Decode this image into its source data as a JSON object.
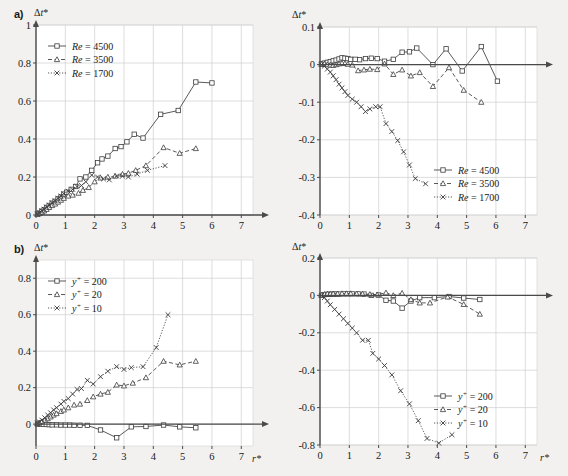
{
  "figure": {
    "background_color": "#f2f1ef",
    "axis_color": "#4a4a4a",
    "grid_color": "#cfcfcf",
    "series_color": "#3c3c3c"
  },
  "panels": [
    {
      "tag": "a)",
      "position": "top-left",
      "ylabel": "Δt*",
      "xlabel": "",
      "legend_position": "top-left"
    },
    {
      "tag": "",
      "position": "top-right",
      "ylabel": "Δt*",
      "xlabel": "",
      "legend_position": "bottom-right"
    },
    {
      "tag": "b)",
      "position": "bottom-left",
      "ylabel": "Δt*",
      "xlabel": "r*",
      "legend_position": "top-left"
    },
    {
      "tag": "",
      "position": "bottom-right",
      "ylabel": "Δt*",
      "xlabel": "r*",
      "legend_position": "bottom-right"
    }
  ],
  "chart_data": [
    {
      "id": "panel-a-left",
      "type": "line",
      "title": "a)",
      "xlabel": "",
      "ylabel": "Δt*",
      "xlim": [
        0,
        7.4
      ],
      "ylim": [
        0,
        1.0
      ],
      "xticks": [
        0,
        1,
        2,
        3,
        4,
        5,
        6,
        7
      ],
      "yticks": [
        0,
        0.2,
        0.4,
        0.6,
        0.8,
        1
      ],
      "ytick_labels": [
        "0",
        "0.2",
        "0.4",
        "0.6",
        "0.8",
        "1"
      ],
      "grid": true,
      "legend_position": "top-left",
      "series": [
        {
          "name": "Re = 4500",
          "marker": "square",
          "dash": "solid",
          "x": [
            0.05,
            0.12,
            0.2,
            0.28,
            0.36,
            0.45,
            0.55,
            0.65,
            0.75,
            0.85,
            0.95,
            1.05,
            1.2,
            1.35,
            1.5,
            1.7,
            1.9,
            2.1,
            2.25,
            2.45,
            2.7,
            2.9,
            3.1,
            3.35,
            3.65,
            4.25,
            4.85,
            5.45,
            6.0
          ],
          "y": [
            0.005,
            0.01,
            0.02,
            0.028,
            0.04,
            0.05,
            0.062,
            0.072,
            0.085,
            0.095,
            0.11,
            0.12,
            0.135,
            0.15,
            0.19,
            0.2,
            0.235,
            0.275,
            0.295,
            0.31,
            0.35,
            0.36,
            0.385,
            0.425,
            0.405,
            0.53,
            0.55,
            0.7,
            0.695
          ]
        },
        {
          "name": "Re = 3500",
          "marker": "triangle",
          "dash": "dashed",
          "x": [
            0.05,
            0.12,
            0.2,
            0.28,
            0.36,
            0.45,
            0.55,
            0.65,
            0.75,
            0.85,
            0.95,
            1.1,
            1.25,
            1.45,
            1.6,
            1.8,
            2.0,
            2.2,
            2.45,
            2.7,
            2.95,
            3.15,
            3.4,
            3.75,
            4.35,
            4.9,
            5.45
          ],
          "y": [
            0.004,
            0.008,
            0.015,
            0.022,
            0.03,
            0.04,
            0.05,
            0.058,
            0.068,
            0.078,
            0.088,
            0.1,
            0.105,
            0.115,
            0.13,
            0.145,
            0.175,
            0.195,
            0.2,
            0.205,
            0.215,
            0.22,
            0.235,
            0.26,
            0.355,
            0.325,
            0.35
          ]
        },
        {
          "name": "Re = 1700",
          "marker": "x",
          "dash": "dotted",
          "x": [
            0.05,
            0.12,
            0.2,
            0.28,
            0.36,
            0.45,
            0.55,
            0.65,
            0.75,
            0.85,
            0.95,
            1.1,
            1.25,
            1.4,
            1.55,
            1.7,
            1.9,
            2.1,
            2.3,
            2.5,
            2.75,
            2.95,
            3.15,
            3.45,
            3.8,
            4.4
          ],
          "y": [
            0.006,
            0.012,
            0.022,
            0.03,
            0.042,
            0.052,
            0.065,
            0.075,
            0.088,
            0.1,
            0.112,
            0.125,
            0.135,
            0.15,
            0.155,
            0.175,
            0.21,
            0.2,
            0.19,
            0.185,
            0.205,
            0.205,
            0.2,
            0.215,
            0.235,
            0.26
          ]
        }
      ]
    },
    {
      "id": "panel-a-right",
      "type": "line",
      "title": "",
      "xlabel": "",
      "ylabel": "Δt*",
      "xlim": [
        0,
        7.4
      ],
      "ylim": [
        -0.4,
        0.1
      ],
      "xticks": [
        0,
        1,
        2,
        3,
        4,
        5,
        6,
        7
      ],
      "yticks": [
        0.1,
        0,
        -0.1,
        -0.2,
        -0.3,
        -0.4
      ],
      "ytick_labels": [
        "0.1",
        "0",
        "-0.1",
        "-0.2",
        "-0.3",
        "-0.4"
      ],
      "grid": true,
      "legend_position": "bottom-right",
      "series": [
        {
          "name": "Re = 4500",
          "marker": "square",
          "dash": "solid",
          "x": [
            0.05,
            0.15,
            0.25,
            0.35,
            0.45,
            0.55,
            0.65,
            0.75,
            0.85,
            0.95,
            1.05,
            1.2,
            1.35,
            1.55,
            1.75,
            1.95,
            2.2,
            2.5,
            2.8,
            3.05,
            3.3,
            3.85,
            4.3,
            4.85,
            5.5,
            6.05
          ],
          "y": [
            0.002,
            0.004,
            0.006,
            0.008,
            0.01,
            0.012,
            0.015,
            0.018,
            0.017,
            0.016,
            0.014,
            0.014,
            0.013,
            0.016,
            0.017,
            0.016,
            0.009,
            0.014,
            0.033,
            0.034,
            0.044,
            0.0,
            0.042,
            -0.017,
            0.048,
            -0.044
          ]
        },
        {
          "name": "Re = 3500",
          "marker": "triangle",
          "dash": "dashed",
          "x": [
            0.05,
            0.15,
            0.25,
            0.35,
            0.45,
            0.55,
            0.65,
            0.75,
            0.85,
            0.95,
            1.1,
            1.3,
            1.5,
            1.7,
            1.95,
            2.2,
            2.5,
            2.8,
            3.1,
            3.4,
            3.85,
            4.4,
            4.9,
            5.5
          ],
          "y": [
            0.001,
            0.002,
            0.0,
            -0.001,
            -0.002,
            0.0,
            0.002,
            0.004,
            0.003,
            0.001,
            -0.001,
            -0.016,
            -0.014,
            -0.012,
            -0.013,
            0.002,
            -0.026,
            -0.014,
            -0.03,
            -0.021,
            -0.058,
            -0.008,
            -0.068,
            -0.1
          ]
        },
        {
          "name": "Re = 1700",
          "marker": "x",
          "dash": "dotted",
          "x": [
            0.05,
            0.15,
            0.25,
            0.35,
            0.45,
            0.55,
            0.65,
            0.75,
            0.85,
            0.95,
            1.1,
            1.25,
            1.4,
            1.55,
            1.7,
            1.9,
            2.05,
            2.25,
            2.45,
            2.65,
            2.85,
            3.05,
            3.25,
            3.6
          ],
          "y": [
            0.0,
            -0.004,
            -0.012,
            -0.02,
            -0.03,
            -0.04,
            -0.052,
            -0.062,
            -0.072,
            -0.082,
            -0.092,
            -0.1,
            -0.112,
            -0.125,
            -0.118,
            -0.112,
            -0.112,
            -0.157,
            -0.178,
            -0.202,
            -0.232,
            -0.267,
            -0.303,
            -0.317
          ]
        }
      ]
    },
    {
      "id": "panel-b-left",
      "type": "line",
      "title": "b)",
      "xlabel": "r*",
      "ylabel": "Δt*",
      "xlim": [
        0,
        7.4
      ],
      "ylim": [
        -0.12,
        0.9
      ],
      "xticks": [
        0,
        1,
        2,
        3,
        4,
        5,
        6,
        7
      ],
      "yticks": [
        0,
        0.2,
        0.4,
        0.6,
        0.8
      ],
      "ytick_labels": [
        "0",
        "0.2",
        "0.4",
        "0.6",
        "0.8"
      ],
      "grid": true,
      "legend_position": "top-left",
      "series": [
        {
          "name": "y+ = 200",
          "marker": "square",
          "dash": "solid",
          "x": [
            0.05,
            0.15,
            0.25,
            0.35,
            0.45,
            0.55,
            0.7,
            0.85,
            1.0,
            1.15,
            1.3,
            1.5,
            1.75,
            2.2,
            2.75,
            3.25,
            3.75,
            4.35,
            4.9,
            5.45
          ],
          "y": [
            0.0,
            0.0,
            -0.001,
            -0.002,
            -0.003,
            -0.004,
            -0.004,
            -0.005,
            -0.005,
            -0.005,
            -0.006,
            -0.006,
            -0.007,
            -0.032,
            -0.075,
            -0.015,
            -0.013,
            -0.005,
            -0.015,
            -0.02
          ]
        },
        {
          "name": "y+ = 20",
          "marker": "triangle",
          "dash": "dashed",
          "x": [
            0.05,
            0.12,
            0.2,
            0.3,
            0.4,
            0.5,
            0.6,
            0.7,
            0.85,
            0.95,
            1.1,
            1.3,
            1.5,
            1.75,
            1.95,
            2.2,
            2.45,
            2.75,
            3.0,
            3.3,
            3.75,
            4.35,
            4.9,
            5.45
          ],
          "y": [
            0.004,
            0.008,
            0.014,
            0.022,
            0.03,
            0.04,
            0.05,
            0.058,
            0.07,
            0.078,
            0.09,
            0.105,
            0.11,
            0.13,
            0.15,
            0.165,
            0.175,
            0.215,
            0.21,
            0.225,
            0.255,
            0.345,
            0.325,
            0.345
          ]
        },
        {
          "name": "y+ = 10",
          "marker": "x",
          "dash": "dotted",
          "x": [
            0.05,
            0.12,
            0.2,
            0.3,
            0.4,
            0.5,
            0.6,
            0.7,
            0.85,
            0.95,
            1.1,
            1.25,
            1.4,
            1.55,
            1.75,
            1.95,
            2.2,
            2.45,
            2.75,
            3.0,
            3.25,
            3.65,
            4.1,
            4.5
          ],
          "y": [
            0.006,
            0.012,
            0.022,
            0.035,
            0.05,
            0.062,
            0.078,
            0.09,
            0.11,
            0.125,
            0.14,
            0.165,
            0.19,
            0.195,
            0.24,
            0.22,
            0.26,
            0.29,
            0.315,
            0.3,
            0.31,
            0.315,
            0.42,
            0.6
          ]
        }
      ]
    },
    {
      "id": "panel-b-right",
      "type": "line",
      "title": "",
      "xlabel": "r*",
      "ylabel": "Δt*",
      "xlim": [
        0,
        7.4
      ],
      "ylim": [
        -0.8,
        0.2
      ],
      "xticks": [
        0,
        1,
        2,
        3,
        4,
        5,
        6,
        7
      ],
      "yticks": [
        0.2,
        0,
        -0.2,
        -0.4,
        -0.6,
        -0.8
      ],
      "ytick_labels": [
        "0.2",
        "0",
        "-0.2",
        "-0.4",
        "-0.6",
        "-0.8"
      ],
      "grid": true,
      "legend_position": "bottom-right",
      "series": [
        {
          "name": "y+ = 200",
          "marker": "square",
          "dash": "solid",
          "x": [
            0.05,
            0.15,
            0.25,
            0.35,
            0.45,
            0.55,
            0.65,
            0.8,
            0.95,
            1.1,
            1.3,
            1.5,
            1.75,
            2.0,
            2.25,
            2.5,
            2.8,
            3.1,
            3.4,
            3.9,
            4.4,
            4.9,
            5.45
          ],
          "y": [
            0.0,
            0.004,
            0.006,
            0.006,
            0.007,
            0.007,
            0.007,
            0.008,
            0.008,
            0.008,
            0.008,
            0.007,
            0.0,
            0.002,
            -0.026,
            -0.03,
            -0.068,
            -0.03,
            -0.012,
            -0.012,
            -0.006,
            -0.014,
            -0.022
          ]
        },
        {
          "name": "y+ = 20",
          "marker": "triangle",
          "dash": "dashed",
          "x": [
            0.05,
            0.15,
            0.25,
            0.35,
            0.45,
            0.6,
            0.75,
            0.9,
            1.05,
            1.25,
            1.45,
            1.7,
            1.95,
            2.25,
            2.5,
            2.8,
            3.1,
            3.4,
            3.75,
            4.35,
            4.9,
            5.45
          ],
          "y": [
            0.002,
            0.006,
            0.008,
            0.008,
            0.009,
            0.009,
            0.01,
            0.01,
            0.01,
            0.009,
            0.008,
            0.006,
            0.004,
            0.014,
            0.0,
            0.012,
            -0.022,
            -0.04,
            -0.04,
            -0.008,
            -0.048,
            -0.1
          ]
        },
        {
          "name": "y+ = 10",
          "marker": "x",
          "dash": "dotted",
          "x": [
            0.05,
            0.15,
            0.25,
            0.35,
            0.5,
            0.65,
            0.8,
            0.95,
            1.1,
            1.25,
            1.45,
            1.65,
            1.8,
            2.0,
            2.2,
            2.45,
            2.75,
            3.05,
            3.35,
            3.65,
            4.05,
            4.5
          ],
          "y": [
            0.0,
            -0.012,
            -0.03,
            -0.05,
            -0.075,
            -0.1,
            -0.125,
            -0.15,
            -0.175,
            -0.2,
            -0.24,
            -0.24,
            -0.31,
            -0.34,
            -0.375,
            -0.425,
            -0.51,
            -0.58,
            -0.67,
            -0.765,
            -0.79,
            -0.745
          ]
        }
      ]
    }
  ],
  "legends": {
    "re": [
      {
        "label_prefix": "Re",
        "label_suffix": " = 4500",
        "marker": "square",
        "dash": "solid"
      },
      {
        "label_prefix": "Re",
        "label_suffix": " = 3500",
        "marker": "triangle",
        "dash": "dashed"
      },
      {
        "label_prefix": "Re",
        "label_suffix": " = 1700",
        "marker": "x",
        "dash": "dotted"
      }
    ],
    "yplus": [
      {
        "label_prefix": "y",
        "label_sup": "+",
        "label_suffix": " = 200",
        "marker": "square",
        "dash": "solid"
      },
      {
        "label_prefix": "y",
        "label_sup": "+",
        "label_suffix": " = 20",
        "marker": "triangle",
        "dash": "dashed"
      },
      {
        "label_prefix": "y",
        "label_sup": "+",
        "label_suffix": " = 10",
        "marker": "x",
        "dash": "dotted"
      }
    ]
  }
}
